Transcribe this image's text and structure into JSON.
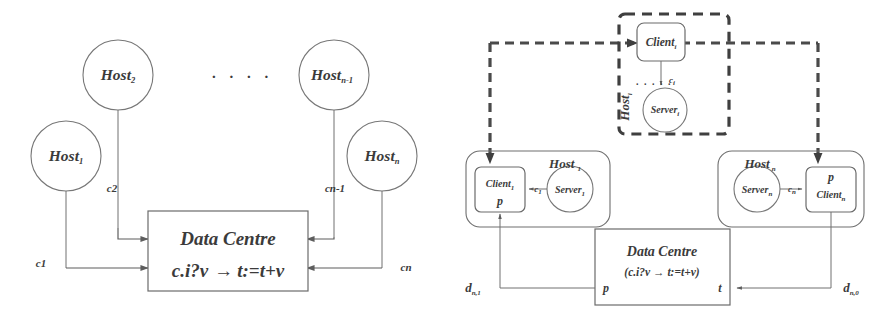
{
  "figure": {
    "ink_color": "#6e6e6e",
    "dash_color": "#3f3f3f",
    "background": "#ffffff"
  },
  "left_diagram": {
    "name": "abstract-host-data-centre",
    "hosts": [
      {
        "id": "host1",
        "label": "Host",
        "subscript": "1"
      },
      {
        "id": "host2",
        "label": "Host",
        "subscript": "2"
      },
      {
        "id": "hostn1",
        "label": "Host",
        "subscript": "n-1"
      },
      {
        "id": "hostn",
        "label": "Host",
        "subscript": "n"
      }
    ],
    "ellipsis": ". . . .",
    "channels": [
      {
        "id": "c1",
        "label": "c1"
      },
      {
        "id": "c2",
        "label": "c2"
      },
      {
        "id": "cn1",
        "label": "cn-1"
      },
      {
        "id": "cn",
        "label": "cn"
      }
    ],
    "data_centre": {
      "title": "Data Centre",
      "guard": "c.i?v",
      "arrow": "→",
      "action": "t:=t+v"
    }
  },
  "right_diagram": {
    "name": "refined-client-server-data-centre",
    "host_left": {
      "label": "Host",
      "subscript": "1",
      "client": {
        "label": "Client",
        "subscript": "1"
      },
      "client_port": "p",
      "server": {
        "label": "Server",
        "subscript": "1"
      },
      "channel": "c",
      "channel_subscript": "1"
    },
    "host_middle": {
      "label": "Host",
      "subscript": "i",
      "client": {
        "label": "Client",
        "subscript": "i"
      },
      "server": {
        "label": "Server",
        "subscript": "i"
      },
      "channel": "c",
      "channel_subscript": "i",
      "ellipsis": ". . . . ."
    },
    "host_right": {
      "label": "Host",
      "subscript": "n",
      "client": {
        "label": "Client",
        "subscript": "n"
      },
      "client_port": "p",
      "server": {
        "label": "Server",
        "subscript": "n"
      },
      "channel": "c",
      "channel_subscript": "n"
    },
    "data_centre": {
      "title": "Data Centre",
      "body": "(c.i?v → t:=t+v)",
      "port_left": "p",
      "port_right": "t"
    },
    "bus_labels": [
      {
        "id": "d-left",
        "label": "d",
        "subscript": "n,1"
      },
      {
        "id": "d-right",
        "label": "d",
        "subscript": "n,0"
      }
    ]
  }
}
